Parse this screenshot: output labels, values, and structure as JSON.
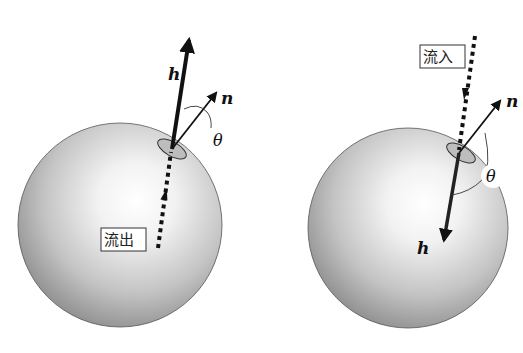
{
  "figure": {
    "left_panel": {
      "vector_h_label": "h",
      "vector_n_label": "n",
      "angle_label": "θ",
      "flow_label": "流出",
      "flow_direction": "outflow"
    },
    "right_panel": {
      "vector_h_label": "h",
      "vector_n_label": "n",
      "angle_label": "θ",
      "flow_label": "流入",
      "flow_direction": "inflow"
    }
  }
}
